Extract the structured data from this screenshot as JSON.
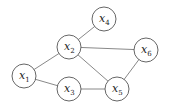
{
  "graph": {
    "nodes": [
      {
        "id": "x1",
        "label": "x",
        "sub": "1",
        "cx": 24,
        "cy": 76
      },
      {
        "id": "x2",
        "label": "x",
        "sub": "2",
        "cx": 69,
        "cy": 47
      },
      {
        "id": "x3",
        "label": "x",
        "sub": "3",
        "cx": 69,
        "cy": 89
      },
      {
        "id": "x4",
        "label": "x",
        "sub": "4",
        "cx": 104,
        "cy": 19
      },
      {
        "id": "x5",
        "label": "x",
        "sub": "5",
        "cx": 117,
        "cy": 89
      },
      {
        "id": "x6",
        "label": "x",
        "sub": "6",
        "cx": 146,
        "cy": 50
      }
    ],
    "edges": [
      [
        "x1",
        "x2"
      ],
      [
        "x1",
        "x3"
      ],
      [
        "x2",
        "x4"
      ],
      [
        "x2",
        "x6"
      ],
      [
        "x2",
        "x5"
      ],
      [
        "x3",
        "x5"
      ],
      [
        "x5",
        "x6"
      ]
    ],
    "node_radius": 12
  }
}
